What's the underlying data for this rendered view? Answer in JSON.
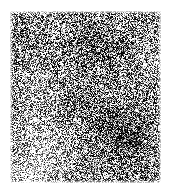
{
  "image": {
    "kind": "grayscale-noise-texture",
    "description": "High-contrast pixel-level grayscale speckle texture with low-frequency light and dark patches",
    "canvas_width": 171,
    "canvas_height": 195,
    "background_color": "#ffffff",
    "panel": {
      "left": 10,
      "top": 11,
      "width": 151,
      "height": 172,
      "base_color": "#8a8a8a"
    },
    "texture": {
      "seed": 20240517,
      "noise_type": "uniform-per-pixel",
      "noise_amplitude": 118,
      "mean_level": 138,
      "black_point": "#101010",
      "white_point": "#ffffff",
      "contrast_gain": 1.55,
      "pixel_scale": 1
    },
    "luminance_blobs": [
      {
        "name": "bright-left-center",
        "cx": 30,
        "cy": 140,
        "rx": 52,
        "ry": 56,
        "delta": 46
      },
      {
        "name": "bright-lower-left",
        "cx": 18,
        "cy": 168,
        "rx": 40,
        "ry": 34,
        "delta": 40
      },
      {
        "name": "bright-mid-left",
        "cx": 22,
        "cy": 78,
        "rx": 34,
        "ry": 40,
        "delta": 26
      },
      {
        "name": "bright-right-edge",
        "cx": 146,
        "cy": 52,
        "rx": 28,
        "ry": 40,
        "delta": 22
      },
      {
        "name": "bright-top-left",
        "cx": 36,
        "cy": 16,
        "rx": 34,
        "ry": 20,
        "delta": 18
      },
      {
        "name": "dark-center-right",
        "cx": 112,
        "cy": 120,
        "rx": 44,
        "ry": 42,
        "delta": -48
      },
      {
        "name": "dark-upper-center",
        "cx": 86,
        "cy": 38,
        "rx": 46,
        "ry": 34,
        "delta": -34
      },
      {
        "name": "dark-core-right",
        "cx": 118,
        "cy": 132,
        "rx": 20,
        "ry": 18,
        "delta": -30
      },
      {
        "name": "dark-mid-band",
        "cx": 78,
        "cy": 96,
        "rx": 40,
        "ry": 30,
        "delta": -22
      },
      {
        "name": "dark-bottom-right",
        "cx": 126,
        "cy": 166,
        "rx": 34,
        "ry": 26,
        "delta": -20
      },
      {
        "name": "dark-left-top",
        "cx": 8,
        "cy": 30,
        "rx": 20,
        "ry": 26,
        "delta": -16
      }
    ]
  }
}
